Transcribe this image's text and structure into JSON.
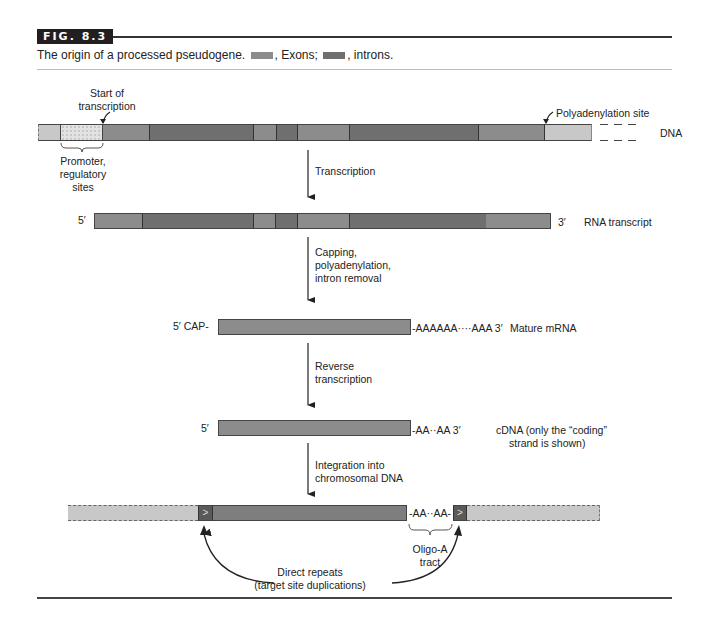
{
  "figure": {
    "tag": "FIG. 8.3",
    "caption_prefix": "The origin of a processed pseudogene.",
    "caption_exons": ", Exons;",
    "caption_introns": ", introns."
  },
  "colors": {
    "exon": "#8c8c8c",
    "intron": "#6f6f6f",
    "flank": "#c8c8c8",
    "promoter": "#e2e2e2",
    "repeat": "#5a5a5a",
    "rule": "#231f20"
  },
  "dna": {
    "label": "DNA",
    "start_label_1": "Start of",
    "start_label_2": "transcription",
    "polya_label": "Polyadenylation site",
    "promoter_1": "Promoter,",
    "promoter_2": "regulatory",
    "promoter_3": "sites"
  },
  "steps": {
    "transcription": "Transcription",
    "processing_1": "Capping,",
    "processing_2": "polyadenylation,",
    "processing_3": "intron removal",
    "rt_1": "Reverse",
    "rt_2": "transcription",
    "integration_1": "Integration into",
    "integration_2": "chromosomal DNA"
  },
  "rna": {
    "five": "5′",
    "three": "3′",
    "label": "RNA transcript"
  },
  "mrna": {
    "five": "5′ CAP-",
    "tail": "-AAAAAA····AAA  3′",
    "label": "Mature mRNA"
  },
  "cdna": {
    "five": "5′",
    "tail": "-AA··AA  3′",
    "label_1": "cDNA (only the “coding”",
    "label_2": "strand is shown)"
  },
  "chromosome": {
    "tract_text": "-AA··AA-",
    "repeat_glyph": ">",
    "oligo_1": "Oligo-A",
    "oligo_2": "tract",
    "repeats_1": "Direct repeats",
    "repeats_2": "(target site duplications)"
  }
}
